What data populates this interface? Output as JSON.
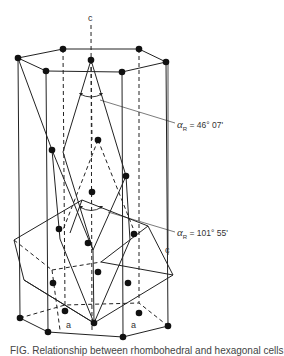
{
  "figure": {
    "type": "crystal-structure-diagram",
    "axis_labels": {
      "c_top": "c",
      "c_right": "c",
      "a_left": "a",
      "a_right": "a"
    },
    "angle_labels": [
      {
        "symbol": "α",
        "subscript": "R",
        "value": "= 46° 07'"
      },
      {
        "symbol": "α",
        "subscript": "R",
        "value": "= 101° 55'"
      }
    ],
    "caption": "FIG. Relationship between rhombohedral and hexagonal cells"
  }
}
